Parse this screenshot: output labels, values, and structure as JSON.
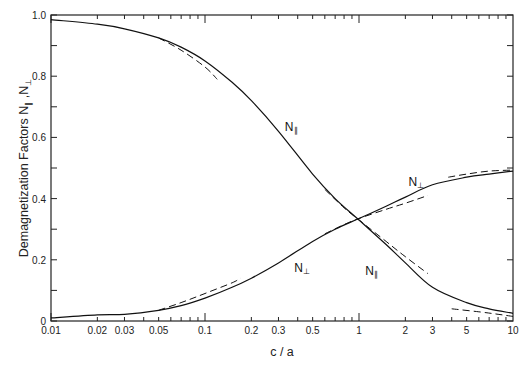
{
  "chart_data": {
    "type": "line",
    "title": "",
    "xlabel": "c / a",
    "ylabel": "Demagnetization Factors N∥ , N⊥",
    "xscale": "log",
    "xlim": [
      0.01,
      10
    ],
    "ylim": [
      0,
      1.0
    ],
    "grid": false,
    "legend": "none (curves labeled inline)",
    "x_tick_labels": [
      "0.01",
      "0.02",
      "0.03",
      "0.05",
      "0.1",
      "0.2",
      "0.3",
      "0.5",
      "1",
      "2",
      "3",
      "5",
      "10"
    ],
    "y_tick_labels": [
      "0",
      "0.2",
      "0.4",
      "0.6",
      "0.8",
      "1.0"
    ],
    "x": [
      0.01,
      0.02,
      0.03,
      0.05,
      0.07,
      0.1,
      0.15,
      0.2,
      0.3,
      0.5,
      0.7,
      1,
      1.5,
      2,
      3,
      5,
      7,
      10
    ],
    "series": [
      {
        "name": "N∥ (exact)",
        "style": "solid",
        "values": [
          0.985,
          0.97,
          0.955,
          0.925,
          0.895,
          0.85,
          0.78,
          0.72,
          0.62,
          0.48,
          0.4,
          0.33,
          0.25,
          0.19,
          0.11,
          0.06,
          0.04,
          0.025
        ]
      },
      {
        "name": "N⊥ (exact)",
        "style": "solid",
        "values": [
          0.01,
          0.02,
          0.022,
          0.035,
          0.05,
          0.075,
          0.11,
          0.14,
          0.19,
          0.26,
          0.3,
          0.335,
          0.375,
          0.405,
          0.445,
          0.47,
          0.48,
          0.49
        ]
      },
      {
        "name": "N∥ (thin-disk approximation)",
        "style": "dashed",
        "x": [
          0.05,
          0.07,
          0.1,
          0.12
        ],
        "values": [
          0.925,
          0.885,
          0.83,
          0.79
        ]
      },
      {
        "name": "N⊥ (thin-disk approximation)",
        "style": "dashed",
        "x": [
          0.05,
          0.07,
          0.1,
          0.15,
          0.17
        ],
        "values": [
          0.035,
          0.06,
          0.09,
          0.125,
          0.14
        ]
      },
      {
        "name": "N∥ (near-sphere approximation)",
        "style": "dashed",
        "x": [
          0.6,
          0.8,
          1,
          1.5,
          2,
          2.8
        ],
        "values": [
          0.43,
          0.37,
          0.33,
          0.26,
          0.21,
          0.155
        ]
      },
      {
        "name": "N⊥ (near-sphere approximation)",
        "style": "dashed",
        "x": [
          0.6,
          0.8,
          1,
          1.5,
          2,
          2.8
        ],
        "values": [
          0.285,
          0.315,
          0.335,
          0.365,
          0.385,
          0.41
        ]
      },
      {
        "name": "N∥ (long-rod approximation)",
        "style": "dashed",
        "x": [
          4,
          6,
          8,
          10
        ],
        "values": [
          0.04,
          0.03,
          0.022,
          0.015
        ]
      },
      {
        "name": "N⊥ (long-rod approximation)",
        "style": "dashed",
        "x": [
          3.8,
          5,
          7,
          10
        ],
        "values": [
          0.47,
          0.48,
          0.49,
          0.493
        ]
      }
    ],
    "annotations": [
      {
        "text": "N∥",
        "x": 0.33,
        "y": 0.62
      },
      {
        "text": "N⊥",
        "x": 2.1,
        "y": 0.44
      },
      {
        "text": "N⊥",
        "x": 0.38,
        "y": 0.16
      },
      {
        "text": "N∥",
        "x": 1.1,
        "y": 0.15
      }
    ]
  },
  "labels": {
    "xlabel": "c / a",
    "ylabel_main": "Demagnetization Factors N",
    "ylabel_sub1": "∥",
    "ylabel_sep": " ,N",
    "ylabel_sub2": "⊥",
    "curve_N": "N",
    "par": "∥",
    "perp": "⊥"
  }
}
